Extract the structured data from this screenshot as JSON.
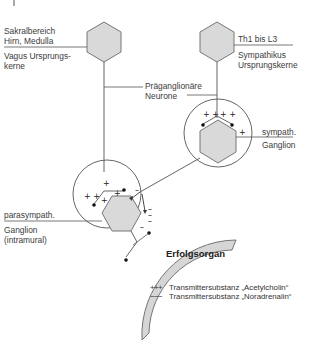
{
  "diagram": {
    "nodes": {
      "parasympathetic_center": {
        "label_top_1": "Sakralbereich",
        "label_top_2": "Hirn, Medulla",
        "label_bottom_1": "Vagus Ursprungs-",
        "label_bottom_2": "kerne"
      },
      "sympathetic_center": {
        "label_top": "Th1 bis L3",
        "label_bottom_1": "Sympathikus",
        "label_bottom_2": "Ursprungskerne"
      },
      "preganglionic": {
        "label_1": "Präganglionäre",
        "label_2": "Neurone"
      },
      "sympathetic_ganglion": {
        "label_1": "sympath.",
        "label_2": "Ganglion"
      },
      "parasympathetic_ganglion": {
        "label_1": "parasympath.",
        "label_2": "Ganglion",
        "label_3": "(intramural)"
      },
      "target_organ": {
        "label": "Erfolgsorgan"
      }
    },
    "legend": [
      {
        "symbol": "+++",
        "label": "Transmittersubstanz „Acetylcholin“"
      },
      {
        "symbol": "−−−",
        "label": "Transmittersubstanz „Noradrenalin“"
      }
    ],
    "colors": {
      "hexagon_fill": "#d9d9d9",
      "hexagon_stroke": "#6e6e6e",
      "line": "#555555",
      "organ_fill": "#d6d6d6"
    }
  }
}
